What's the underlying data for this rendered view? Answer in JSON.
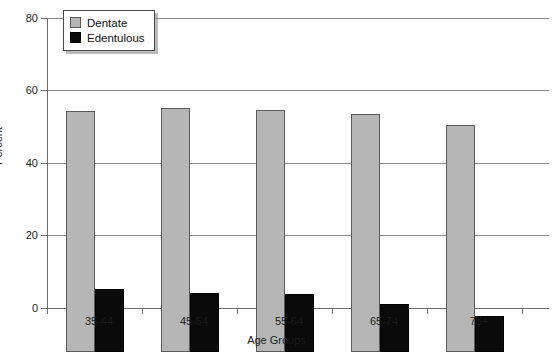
{
  "chart_data": {
    "type": "bar",
    "title": "",
    "xlabel": "Age Groups",
    "ylabel": "Percent",
    "categories": [
      "35-44",
      "45-54",
      "55-64",
      "65-74",
      "75+"
    ],
    "series": [
      {
        "name": "Dentate",
        "color": "#b6b6b6",
        "values": [
          66.5,
          67.3,
          66.8,
          65.6,
          62.5
        ]
      },
      {
        "name": "Edentulous",
        "color": "#0a0a0a",
        "values": [
          17.3,
          16.2,
          15.9,
          13.2,
          10.0
        ]
      }
    ],
    "ylim": [
      0,
      80
    ],
    "yticks": [
      0,
      20,
      40,
      60,
      80
    ],
    "grid": "horizontal",
    "legend_position": "top-left"
  },
  "axes": {
    "y_tick_labels": [
      "0",
      "20",
      "40",
      "60",
      "80"
    ],
    "y_title": "Percent",
    "x_title": "Age Groups",
    "x_tick_labels": [
      "35-44",
      "45-54",
      "55-64",
      "65-74",
      "75+"
    ]
  },
  "legend": {
    "entries": [
      {
        "label": "Dentate",
        "swatch": "dentate-swatch"
      },
      {
        "label": "Edentulous",
        "swatch": "edentulous-swatch"
      }
    ]
  }
}
